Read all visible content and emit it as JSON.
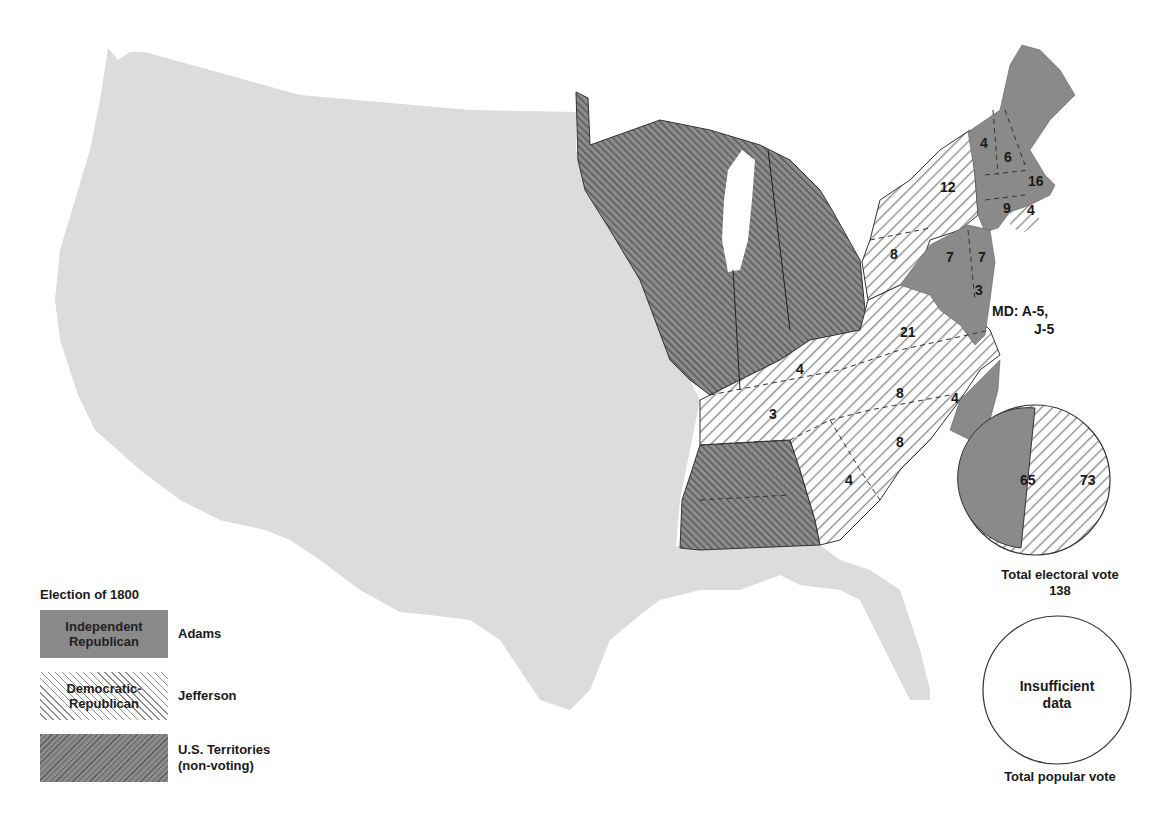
{
  "title": "Election of 1800",
  "legend": {
    "title": "Election of 1800",
    "items": [
      {
        "swatch_label": "Independent Republican",
        "swatch_line1": "Independent",
        "swatch_line2": "Republican",
        "candidate": "Adams",
        "color": "#8a8a8a",
        "pattern": "solid-dark"
      },
      {
        "swatch_label": "Democratic-Republican",
        "swatch_line1": "Democratic-",
        "swatch_line2": "Republican",
        "candidate": "Jefferson",
        "color": "#ffffff",
        "pattern": "diagonal-hatch"
      },
      {
        "swatch_label": "U.S. Territories (non-voting)",
        "swatch_line1": "",
        "swatch_line2": "",
        "candidate": "U.S. Territories",
        "candidate_line2": "(non-voting)",
        "color": "#6e6e6e",
        "pattern": "dense-hatch"
      }
    ]
  },
  "map": {
    "state_votes": [
      {
        "region": "Vermont",
        "votes": "4",
        "party": "Adams"
      },
      {
        "region": "New Hampshire",
        "votes": "6",
        "party": "Adams"
      },
      {
        "region": "Massachusetts",
        "votes": "16",
        "party": "Adams"
      },
      {
        "region": "Connecticut",
        "votes": "9",
        "party": "Adams"
      },
      {
        "region": "Rhode Island",
        "votes": "4",
        "party": "Jefferson"
      },
      {
        "region": "New York",
        "votes": "12",
        "party": "Jefferson"
      },
      {
        "region": "Pennsylvania",
        "votes": "8",
        "party": "Jefferson"
      },
      {
        "region": "New Jersey",
        "votes": "7",
        "party": "Adams"
      },
      {
        "region": "Pennsylvania-east",
        "votes": "7",
        "party": "Adams"
      },
      {
        "region": "Delaware",
        "votes": "3",
        "party": "Adams"
      },
      {
        "region": "Virginia",
        "votes": "21",
        "party": "Jefferson"
      },
      {
        "region": "Kentucky",
        "votes": "4",
        "party": "Jefferson"
      },
      {
        "region": "Tennessee",
        "votes": "3",
        "party": "Jefferson"
      },
      {
        "region": "North Carolina",
        "votes": "8",
        "party": "Jefferson"
      },
      {
        "region": "North Carolina (east)",
        "votes": "4",
        "party": "Adams"
      },
      {
        "region": "South Carolina",
        "votes": "8",
        "party": "Jefferson"
      },
      {
        "region": "Georgia",
        "votes": "4",
        "party": "Jefferson"
      }
    ],
    "maryland_annotation": {
      "line1": "MD:  A-5,",
      "line2": "J-5"
    }
  },
  "electoral_pie": {
    "adams": "65",
    "jefferson": "73",
    "caption_line1": "Total electoral vote",
    "caption_line2": "138"
  },
  "popular_pie": {
    "text_line1": "Insufficient",
    "text_line2": "data",
    "caption": "Total popular vote"
  },
  "colors": {
    "unsettled": "#dcdcdc",
    "adams": "#8a8a8a",
    "territory": "#6e6e6e",
    "jefferson_hatch": "#8f8f8f"
  }
}
